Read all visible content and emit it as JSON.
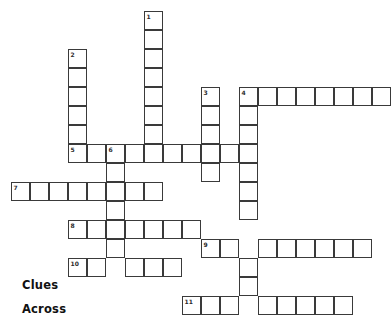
{
  "page": {
    "type": "crossword-puzzle",
    "background_color": "#ffffff",
    "cell_border_color": "#3a3a3a",
    "cell_fill_color": "#ffffff",
    "number_color": "#2b2b2b",
    "text_color": "#111111"
  },
  "headings": {
    "clues_label": "Clues",
    "across_label": "Across"
  },
  "grid": {
    "cell_size": 19,
    "origin_x": 11,
    "origin_y": 11,
    "columns": 19,
    "rows": 16
  },
  "entries": [
    {
      "number": "1",
      "direction": "down",
      "col": 7,
      "row": 0,
      "length": 8
    },
    {
      "number": "2",
      "direction": "down",
      "col": 3,
      "row": 2,
      "length": 6
    },
    {
      "number": "3",
      "direction": "down",
      "col": 10,
      "row": 4,
      "length": 5
    },
    {
      "number": "4",
      "direction": "down",
      "col": 12,
      "row": 4,
      "length": 12
    },
    {
      "number": "4",
      "direction": "across",
      "col": 12,
      "row": 4,
      "length": 8
    },
    {
      "number": "5",
      "direction": "across",
      "col": 3,
      "row": 7,
      "length": 10
    },
    {
      "number": "6",
      "direction": "down",
      "col": 5,
      "row": 7,
      "length": 6
    },
    {
      "number": "7",
      "direction": "across",
      "col": 0,
      "row": 9,
      "length": 8
    },
    {
      "number": "8",
      "direction": "across",
      "col": 3,
      "row": 11,
      "length": 7
    },
    {
      "number": "9",
      "direction": "across",
      "col": 10,
      "row": 12,
      "length": 9
    },
    {
      "number": "10",
      "direction": "across",
      "col": 3,
      "row": 13,
      "length": 6
    },
    {
      "number": "11",
      "direction": "across",
      "col": 9,
      "row": 15,
      "length": 9
    }
  ],
  "cells": [
    {
      "number": "1",
      "col": 7,
      "row": 0
    },
    {
      "col": 7,
      "row": 1
    },
    {
      "col": 7,
      "row": 2
    },
    {
      "col": 7,
      "row": 3
    },
    {
      "col": 7,
      "row": 4
    },
    {
      "col": 7,
      "row": 5
    },
    {
      "col": 7,
      "row": 6
    },
    {
      "number": "2",
      "col": 3,
      "row": 2
    },
    {
      "col": 3,
      "row": 3
    },
    {
      "col": 3,
      "row": 4
    },
    {
      "col": 3,
      "row": 5
    },
    {
      "col": 3,
      "row": 6
    },
    {
      "number": "3",
      "col": 10,
      "row": 4
    },
    {
      "col": 10,
      "row": 5
    },
    {
      "col": 10,
      "row": 6
    },
    {
      "col": 10,
      "row": 8
    },
    {
      "number": "4",
      "col": 12,
      "row": 4
    },
    {
      "col": 13,
      "row": 4
    },
    {
      "col": 14,
      "row": 4
    },
    {
      "col": 15,
      "row": 4
    },
    {
      "col": 16,
      "row": 4
    },
    {
      "col": 17,
      "row": 4
    },
    {
      "col": 18,
      "row": 4
    },
    {
      "col": 19,
      "row": 4
    },
    {
      "col": 12,
      "row": 5
    },
    {
      "col": 12,
      "row": 6
    },
    {
      "col": 12,
      "row": 8
    },
    {
      "col": 12,
      "row": 9
    },
    {
      "col": 12,
      "row": 10
    },
    {
      "col": 12,
      "row": 13
    },
    {
      "col": 12,
      "row": 14
    },
    {
      "number": "5",
      "col": 3,
      "row": 7
    },
    {
      "col": 4,
      "row": 7
    },
    {
      "number": "6",
      "col": 5,
      "row": 7
    },
    {
      "col": 6,
      "row": 7
    },
    {
      "col": 7,
      "row": 7
    },
    {
      "col": 8,
      "row": 7
    },
    {
      "col": 9,
      "row": 7
    },
    {
      "col": 10,
      "row": 7
    },
    {
      "col": 11,
      "row": 7
    },
    {
      "col": 12,
      "row": 7
    },
    {
      "col": 5,
      "row": 8
    },
    {
      "col": 5,
      "row": 9
    },
    {
      "col": 5,
      "row": 10
    },
    {
      "col": 5,
      "row": 11
    },
    {
      "col": 5,
      "row": 12
    },
    {
      "number": "7",
      "col": 0,
      "row": 9
    },
    {
      "col": 1,
      "row": 9
    },
    {
      "col": 2,
      "row": 9
    },
    {
      "col": 3,
      "row": 9
    },
    {
      "col": 4,
      "row": 9
    },
    {
      "col": 6,
      "row": 9
    },
    {
      "col": 7,
      "row": 9
    },
    {
      "number": "8",
      "col": 3,
      "row": 11
    },
    {
      "col": 4,
      "row": 11
    },
    {
      "col": 6,
      "row": 11
    },
    {
      "col": 7,
      "row": 11
    },
    {
      "col": 8,
      "row": 11
    },
    {
      "col": 9,
      "row": 11
    },
    {
      "number": "9",
      "col": 10,
      "row": 12
    },
    {
      "col": 11,
      "row": 12
    },
    {
      "col": 13,
      "row": 12
    },
    {
      "col": 14,
      "row": 12
    },
    {
      "col": 15,
      "row": 12
    },
    {
      "col": 16,
      "row": 12
    },
    {
      "col": 17,
      "row": 12
    },
    {
      "col": 18,
      "row": 12
    },
    {
      "number": "10",
      "col": 3,
      "row": 13
    },
    {
      "col": 4,
      "row": 13
    },
    {
      "col": 6,
      "row": 13
    },
    {
      "col": 7,
      "row": 13
    },
    {
      "col": 8,
      "row": 13
    },
    {
      "number": "11",
      "col": 9,
      "row": 15
    },
    {
      "col": 10,
      "row": 15
    },
    {
      "col": 11,
      "row": 15
    },
    {
      "col": 13,
      "row": 15
    },
    {
      "col": 14,
      "row": 15
    },
    {
      "col": 15,
      "row": 15
    },
    {
      "col": 16,
      "row": 15
    },
    {
      "col": 17,
      "row": 15
    }
  ]
}
